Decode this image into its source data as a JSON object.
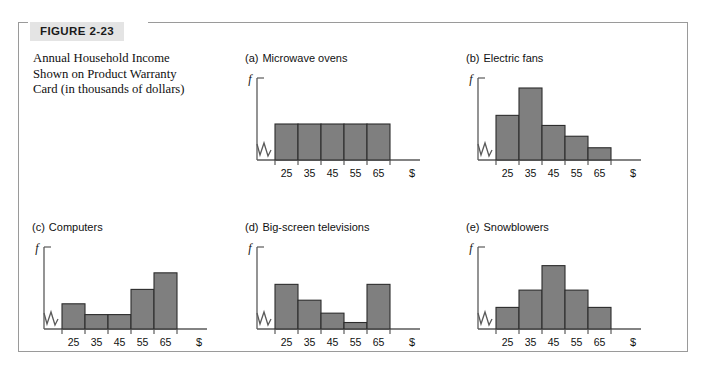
{
  "figure": {
    "label": "FIGURE 2-23",
    "caption_lines": [
      "Annual Household Income",
      "Shown on Product Warranty",
      "Card (in thousands of dollars)"
    ],
    "caption_full": "Annual Household Income Shown on Product Warranty Card (in thousands of dollars)",
    "border_color": "#9a9a9a",
    "label_bg_color": "#e4e4e4"
  },
  "chart_data": [
    {
      "type": "bar",
      "panel_tag": "(a)",
      "title": "Microwave ovens",
      "categories": [
        "25",
        "35",
        "45",
        "55",
        "65"
      ],
      "values": [
        50,
        50,
        50,
        50,
        50
      ],
      "xlabel": "$",
      "ylabel": "f",
      "ylim": [
        0,
        100
      ],
      "grid": false,
      "legend": "none",
      "bar_color": "#7f7f7f",
      "bar_edge_color": "#2c2c2c",
      "shape": "uniform",
      "axis_break": true
    },
    {
      "type": "bar",
      "panel_tag": "(b)",
      "title": "Electric fans",
      "categories": [
        "25",
        "35",
        "45",
        "55",
        "65"
      ],
      "values": [
        62,
        100,
        48,
        33,
        17
      ],
      "xlabel": "$",
      "ylabel": "f",
      "ylim": [
        0,
        100
      ],
      "grid": false,
      "legend": "none",
      "bar_color": "#7f7f7f",
      "bar_edge_color": "#2c2c2c",
      "shape": "skewed-right",
      "axis_break": true
    },
    {
      "type": "bar",
      "panel_tag": "(c)",
      "title": "Computers",
      "categories": [
        "25",
        "35",
        "45",
        "55",
        "65"
      ],
      "values": [
        35,
        20,
        20,
        55,
        78
      ],
      "xlabel": "$",
      "ylabel": "f",
      "ylim": [
        0,
        100
      ],
      "grid": false,
      "legend": "none",
      "bar_color": "#7f7f7f",
      "bar_edge_color": "#2c2c2c",
      "shape": "skewed-left",
      "axis_break": true
    },
    {
      "type": "bar",
      "panel_tag": "(d)",
      "title": "Big-screen televisions",
      "categories": [
        "25",
        "35",
        "45",
        "55",
        "65"
      ],
      "values": [
        62,
        40,
        22,
        9,
        62
      ],
      "xlabel": "$",
      "ylabel": "f",
      "ylim": [
        0,
        100
      ],
      "grid": false,
      "legend": "none",
      "bar_color": "#7f7f7f",
      "bar_edge_color": "#2c2c2c",
      "shape": "bimodal",
      "axis_break": true
    },
    {
      "type": "bar",
      "panel_tag": "(e)",
      "title": "Snowblowers",
      "categories": [
        "25",
        "35",
        "45",
        "55",
        "65"
      ],
      "values": [
        30,
        54,
        88,
        54,
        30
      ],
      "xlabel": "$",
      "ylabel": "f",
      "ylim": [
        0,
        100
      ],
      "grid": false,
      "legend": "none",
      "bar_color": "#7f7f7f",
      "bar_edge_color": "#2c2c2c",
      "shape": "symmetric",
      "axis_break": true
    }
  ]
}
